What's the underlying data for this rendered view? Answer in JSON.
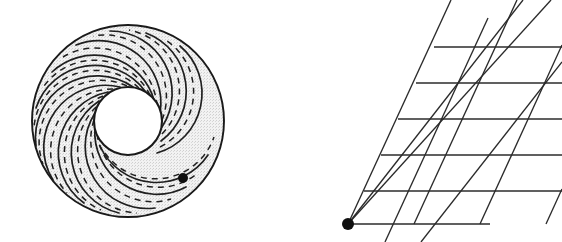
{
  "figure": {
    "background_color": "#ffffff",
    "ink_color": "#1a1a1a",
    "shading_color": "#e9e9e9",
    "panels": [
      {
        "id": "annulus-panel",
        "name": "annulus-with-spiral-leaves",
        "label": "",
        "center": [
          128,
          121
        ],
        "outer_radius": 97,
        "inner_radius": 34,
        "leaf_count": 13,
        "solid_leaf_count": 13,
        "dashed_leaf_count": 13,
        "marked_point": [
          183,
          178
        ],
        "marked_point_radius": 5,
        "shading": "stipple-gray",
        "outer_boundary_style": "solid",
        "inner_boundary_style": "solid",
        "leaf_style_solid": "solid",
        "leaf_style_dashed": "dashed"
      },
      {
        "id": "lattice-panel",
        "name": "sheared-lattice-universal-cover",
        "label": "",
        "base_point": [
          348,
          224
        ],
        "base_point_radius": 6,
        "horizontal_line_count": 6,
        "horizontal_line_y": [
          47,
          83,
          119,
          155,
          191,
          224
        ],
        "shear_line_count": 5,
        "steep_line_count": 3,
        "shear_slope_dx_per_dy": -0.46,
        "steep_slope_dx_per_dy": -0.3,
        "right_extent": 562,
        "bottom_extent": 224
      }
    ]
  },
  "marks": {
    "annulus_point_label": "",
    "lattice_point_label": ""
  },
  "colors": {
    "ink": "#1a1a1a",
    "shade": "#e9e9e9",
    "line": "#2b2b2b",
    "paper": "#ffffff"
  }
}
